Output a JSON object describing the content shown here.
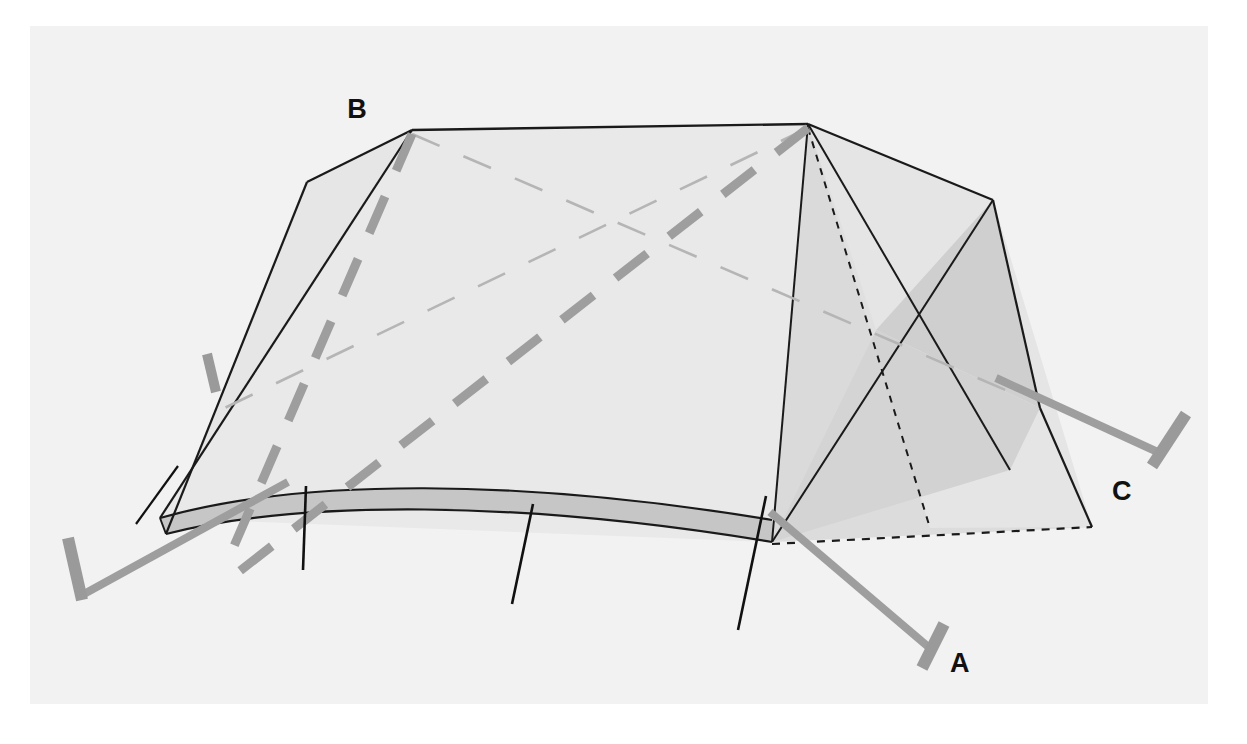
{
  "figure": {
    "kind": "technical-line-illustration",
    "background_color": "#ffffff",
    "canvas_color": "#f2f2f2",
    "canvas": {
      "x": 30,
      "y": 26,
      "width": 1178,
      "height": 678
    }
  },
  "palette": {
    "outline": "#1a1a1a",
    "fabric_light": "#ebebeb",
    "fabric_mid": "#dcdcdc",
    "fabric_dark": "#c9c9c9",
    "guyline_gray": "#9e9e9e",
    "pole_thin_gray": "#b5b5b5",
    "peg_gray": "#9a9a9a",
    "label_black": "#111111"
  },
  "labels": [
    {
      "id": "label-a",
      "text": "A",
      "x": 944,
      "y": 668,
      "desc": "front right guy line peg"
    },
    {
      "id": "label-b",
      "text": "B",
      "x": 357,
      "y": 118,
      "desc": "rear left ridge apex"
    },
    {
      "id": "label-c",
      "text": "C",
      "x": 1110,
      "y": 494,
      "desc": "right side guy line peg"
    }
  ],
  "geometry": {
    "apex_left": {
      "x": 412,
      "y": 130
    },
    "apex_right": {
      "x": 808,
      "y": 124
    },
    "roof_corner_left": {
      "x": 307,
      "y": 182
    },
    "roof_corner_right": {
      "x": 993,
      "y": 200
    },
    "base_front_left": {
      "x": 160,
      "y": 518
    },
    "base_front_mid": {
      "x": 770,
      "y": 542
    },
    "base_back_right": {
      "x": 1092,
      "y": 527
    },
    "base_left_low": {
      "x": 166,
      "y": 534
    }
  },
  "pegs": [
    {
      "id": "peg-front-left",
      "label": "",
      "tip": {
        "x": 68,
        "y": 538
      },
      "base": {
        "x": 82,
        "y": 600
      }
    },
    {
      "id": "peg-a",
      "label": "A",
      "tip": {
        "x": 944,
        "y": 626
      },
      "base": {
        "x": 922,
        "y": 668
      }
    },
    {
      "id": "peg-c",
      "label": "C",
      "tip": {
        "x": 1186,
        "y": 416
      },
      "base": {
        "x": 1152,
        "y": 466
      }
    },
    {
      "id": "peg-rear-left",
      "label": "",
      "tip": {
        "x": 207,
        "y": 356
      },
      "base": {
        "x": 216,
        "y": 392
      }
    }
  ],
  "guy_lines": [
    {
      "id": "guyline-front-left",
      "from": {
        "x": 82,
        "y": 596
      },
      "to": {
        "x": 286,
        "y": 484
      }
    },
    {
      "id": "guyline-a",
      "from": {
        "x": 930,
        "y": 648
      },
      "to": {
        "x": 772,
        "y": 514
      }
    },
    {
      "id": "guyline-c",
      "from": {
        "x": 1160,
        "y": 452
      },
      "to": {
        "x": 996,
        "y": 380
      }
    }
  ],
  "interior_poles": [
    {
      "id": "pole-diagonal-thick-1",
      "style": "thick-dashed",
      "from": {
        "x": 412,
        "y": 134
      },
      "to": {
        "x": 232,
        "y": 556
      }
    },
    {
      "id": "pole-diagonal-thick-2",
      "style": "thick-dashed",
      "from": {
        "x": 808,
        "y": 128
      },
      "to": {
        "x": 240,
        "y": 570
      }
    },
    {
      "id": "pole-diagonal-thin-1",
      "style": "thin-dashed",
      "from": {
        "x": 412,
        "y": 134
      },
      "to": {
        "x": 1006,
        "y": 386
      }
    },
    {
      "id": "pole-diagonal-thin-2",
      "style": "thin-dashed",
      "from": {
        "x": 808,
        "y": 128
      },
      "to": {
        "x": 220,
        "y": 412
      }
    }
  ],
  "hidden_edges": [
    {
      "id": "hidden-edge-vertical",
      "style": "fine-dashed",
      "from": {
        "x": 808,
        "y": 128
      },
      "to": {
        "x": 930,
        "y": 528
      }
    },
    {
      "id": "hidden-edge-floor",
      "style": "fine-dashed",
      "from": {
        "x": 772,
        "y": 544
      },
      "to": {
        "x": 1092,
        "y": 527
      }
    }
  ],
  "ground_pegs_small": [
    {
      "id": "ground-peg-1",
      "from": {
        "x": 306,
        "y": 486
      },
      "to": {
        "x": 303,
        "y": 570
      }
    },
    {
      "id": "ground-peg-2",
      "from": {
        "x": 533,
        "y": 504
      },
      "to": {
        "x": 512,
        "y": 604
      }
    },
    {
      "id": "ground-peg-3",
      "from": {
        "x": 766,
        "y": 496
      },
      "to": {
        "x": 738,
        "y": 630
      }
    }
  ],
  "annotations": {
    "title": "",
    "caption": "",
    "notes": ""
  }
}
